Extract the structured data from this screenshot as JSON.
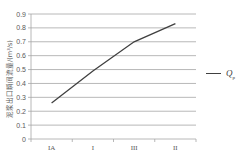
{
  "chart_data": {
    "type": "line",
    "title": "",
    "xlabel": "",
    "ylabel": "泥浆出口瞬间流量/(m³/s)",
    "categories": [
      "IA",
      "I",
      "III",
      "II"
    ],
    "series": [
      {
        "name": "Qp",
        "values": [
          0.26,
          0.49,
          0.7,
          0.83
        ],
        "color": "#404040"
      }
    ],
    "ylim": [
      0,
      0.9
    ],
    "yticks": [
      "0",
      "0.1",
      "0.2",
      "0.3",
      "0.4",
      "0.5",
      "0.6",
      "0.7",
      "0.8",
      "0.9"
    ],
    "grid": true,
    "legend_position": "right"
  },
  "legend": {
    "symbol": "Q",
    "subscript": "p"
  },
  "colors": {
    "line": "#404040",
    "grid": "#a6a6a6",
    "axis": "#a6a6a6",
    "text": "#595959"
  }
}
